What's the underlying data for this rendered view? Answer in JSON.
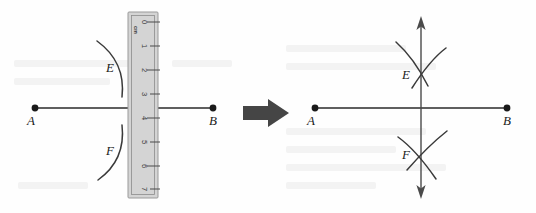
{
  "figure": {
    "background_color": "#fefefe",
    "width": 536,
    "height": 213
  },
  "panels": [
    {
      "id": "left",
      "name": "construction-with-ruler",
      "segment": {
        "label_start": "A",
        "label_end": "B",
        "start_x": 35,
        "end_x": 213,
        "y": 108
      },
      "arcs": [
        {
          "label": "E",
          "position": "above"
        },
        {
          "label": "F",
          "position": "below"
        }
      ],
      "ruler": {
        "unit_label": "cm",
        "ticks": [
          "0",
          "1",
          "2",
          "3",
          "4",
          "5",
          "6",
          "7"
        ],
        "left_x": 128,
        "right_x": 158,
        "top_y": 12,
        "bottom_y": 198,
        "fill_color": "#d4d4d4",
        "border_color": "#9a9a9a"
      }
    },
    {
      "id": "right",
      "name": "completed-perpendicular-bisector",
      "segment": {
        "label_start": "A",
        "label_end": "B",
        "start_x": 315,
        "end_x": 507,
        "y": 108
      },
      "bisector": {
        "name": "vertical-double-arrow",
        "x": 421,
        "top_y": 18,
        "bottom_y": 197,
        "arrowheads": "both"
      },
      "intersections": [
        {
          "label": "E",
          "x": 421,
          "y": 75
        },
        {
          "label": "F",
          "x": 421,
          "y": 155
        }
      ]
    }
  ],
  "transition": {
    "name": "implies-arrow",
    "direction": "right",
    "color": "#454545",
    "x": 243,
    "y": 113
  },
  "colors": {
    "ink": "#2b2b2b",
    "arc": "#3a3a3a",
    "axis": "#4a4a4a",
    "ruler_fill": "#d4d4d4",
    "arrow": "#454545"
  }
}
